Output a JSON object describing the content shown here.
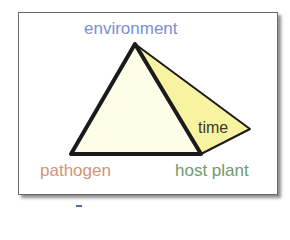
{
  "diagram": {
    "type": "disease pyramid",
    "labels": {
      "environment": "environment",
      "pathogen": "pathogen",
      "host_plant": "host plant",
      "time": "time"
    },
    "colors": {
      "environment": "#7b8fcf",
      "pathogen": "#d4937a",
      "host_plant": "#6f9a6f",
      "time": "#3a3a2a",
      "front_face": "#fefde8",
      "side_face": "#f8f3a0",
      "stroke": "#1a1a1a",
      "dash": "#5566aa"
    },
    "vertices": {
      "apex": [
        135,
        44
      ],
      "bottom_left": [
        71,
        154
      ],
      "bottom_right": [
        201,
        154
      ],
      "right": [
        250,
        129
      ]
    }
  }
}
